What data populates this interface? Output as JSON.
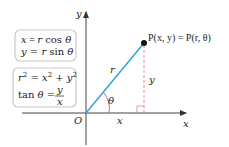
{
  "diagram": {
    "axes": {
      "x_label": "x",
      "y_label": "y",
      "origin_label": "O"
    },
    "point_label": "P(x, y) = P(r, θ)",
    "segment_labels": {
      "radius": "r",
      "angle": "θ",
      "horizontal_leg": "x",
      "vertical_leg": "y"
    },
    "formula_boxes": [
      {
        "lines": [
          "x = r cos θ",
          "y = r sin θ"
        ]
      },
      {
        "lines": [
          "r² = x² + y²",
          "tan θ = y/x"
        ]
      }
    ],
    "formulas": {
      "box1_line1": {
        "lhs": "x",
        "eq": " = ",
        "r": "r",
        "fn": " cos ",
        "theta": "θ"
      },
      "box1_line2": {
        "lhs": "y",
        "eq": " = ",
        "r": "r",
        "fn": " sin ",
        "theta": "θ"
      },
      "box2_line1": {
        "lhs": "r",
        "sup": "2",
        "eq": " = ",
        "x": "x",
        "plus": " + ",
        "y": "y"
      },
      "box2_line2": {
        "fn": "tan ",
        "theta": "θ",
        "eq": " = ",
        "num": "y",
        "den": "x"
      }
    },
    "colors": {
      "radius_line": "#3aa6d8",
      "dashed_line": "#e08a9a",
      "right_angle": "#e08a9a",
      "angle_arc": "#c0435a",
      "axes": "#333333",
      "box_border": "#c9c9c9"
    }
  }
}
